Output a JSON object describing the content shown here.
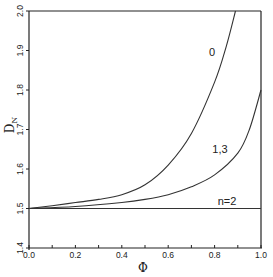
{
  "chart_data": {
    "type": "line",
    "title": "",
    "xlabel": "Φ",
    "ylabel": "D_N",
    "ylabel_main": "D",
    "ylabel_sub": "N",
    "xlim": [
      0.0,
      1.0
    ],
    "ylim": [
      1.4,
      2.0
    ],
    "grid": false,
    "legend": "none (inline curve labels)",
    "x_ticks": [
      "0.0",
      "0.2",
      "0.4",
      "0.6",
      "0.8",
      "1.0"
    ],
    "y_ticks": [
      "1.4",
      "1.5",
      "1.6",
      "1.7",
      "1.8",
      "1.9",
      "2.0"
    ],
    "series": [
      {
        "name": "0",
        "label": "0",
        "x": [
          0.0,
          0.1,
          0.2,
          0.3,
          0.4,
          0.5,
          0.6,
          0.7,
          0.8,
          0.85,
          0.89
        ],
        "y": [
          1.5,
          1.507,
          1.515,
          1.523,
          1.535,
          1.56,
          1.61,
          1.69,
          1.82,
          1.91,
          2.0
        ]
      },
      {
        "name": "1,3",
        "label": "1,3",
        "x": [
          0.0,
          0.2,
          0.4,
          0.5,
          0.6,
          0.7,
          0.8,
          0.9,
          0.95,
          1.0
        ],
        "y": [
          1.5,
          1.505,
          1.515,
          1.523,
          1.535,
          1.555,
          1.585,
          1.64,
          1.7,
          1.8
        ]
      },
      {
        "name": "n=2",
        "label": "n=2",
        "x": [
          0.0,
          1.0
        ],
        "y": [
          1.5,
          1.5
        ]
      }
    ]
  }
}
